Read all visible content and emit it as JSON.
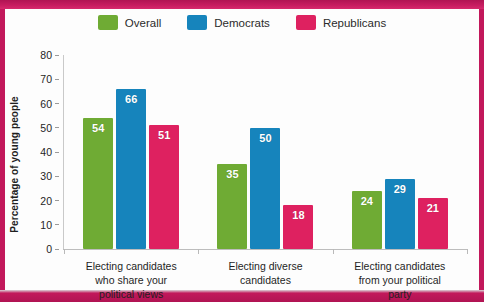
{
  "chart_data": {
    "type": "bar",
    "title": "",
    "xlabel": "",
    "ylabel": "Percentage of young people",
    "ylim": [
      0,
      80
    ],
    "ytick_values": [
      80,
      70,
      60,
      50,
      40,
      30,
      20,
      10,
      0
    ],
    "ytick_labels": [
      "80",
      "70",
      "60",
      "50",
      "40",
      "30",
      "20",
      "10",
      "0"
    ],
    "grid": false,
    "legend_position": "top-center",
    "categories": [
      "Electing candidates who share your political views",
      "Electing diverse candidates",
      "Electing candidates from your political party"
    ],
    "category_lines": [
      [
        "Electing candidates",
        "who share your",
        "political views"
      ],
      [
        "Electing diverse",
        "candidates"
      ],
      [
        "Electing candidates",
        "from your political",
        "party"
      ]
    ],
    "series": [
      {
        "name": "Overall",
        "color": "#6fab34",
        "values": [
          54,
          35,
          24
        ]
      },
      {
        "name": "Democrats",
        "color": "#1684bc",
        "values": [
          66,
          50,
          29
        ]
      },
      {
        "name": "Republicans",
        "color": "#de2160",
        "values": [
          51,
          18,
          21
        ]
      }
    ]
  },
  "legend": {
    "items": [
      {
        "label": "Overall",
        "color": "#6fab34"
      },
      {
        "label": "Democrats",
        "color": "#1684bc"
      },
      {
        "label": "Republicans",
        "color": "#de2160"
      }
    ]
  },
  "frame": {
    "border_color": "#c2185b"
  }
}
